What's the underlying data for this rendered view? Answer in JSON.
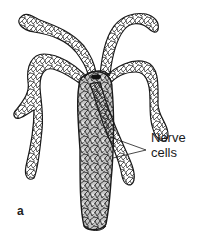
{
  "figure": {
    "panel_label": "a",
    "annotation": {
      "line1": "Nerve",
      "line2": "cells"
    },
    "colors": {
      "outline": "#1a1a1a",
      "cell_fill": "#ffffff",
      "body_shade": "#bdbdbd",
      "mouth": "#111111"
    }
  }
}
